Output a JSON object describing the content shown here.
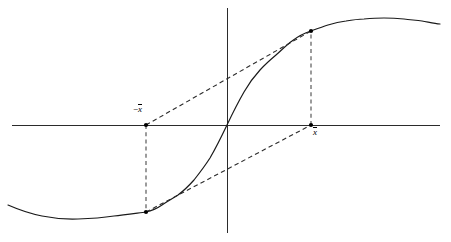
{
  "figure": {
    "labels": {
      "left_point": {
        "minus": "−",
        "symbol": "x",
        "full_text": "−x̄",
        "x": 133,
        "y": 105
      },
      "right_point": {
        "symbol": "x",
        "full_text": "x̄",
        "x": 313,
        "y": 128
      }
    },
    "colors": {
      "axis": "#2b2b2b",
      "curve": "#1a1a1a",
      "dashed_drop": "#4a4a4a",
      "dashed_chord": "#2b2b2b",
      "marker": "#000000",
      "background": "#ffffff"
    }
  },
  "chart_data": {
    "type": "line",
    "title": "",
    "xlabel": "",
    "ylabel": "",
    "grid": false,
    "legend": null,
    "axes": {
      "origin_px": [
        227,
        125
      ],
      "x_axis_px": {
        "x1": 12,
        "y1": 125,
        "x2": 440,
        "y2": 125
      },
      "y_axis_px": {
        "x1": 227,
        "y1": 8,
        "x2": 227,
        "y2": 233
      }
    },
    "curve_points_px": [
      [
        8,
        205
      ],
      [
        24,
        211
      ],
      [
        42,
        216
      ],
      [
        60,
        219
      ],
      [
        78,
        219
      ],
      [
        96,
        218
      ],
      [
        114,
        216
      ],
      [
        130,
        214
      ],
      [
        146,
        212
      ],
      [
        162,
        205
      ],
      [
        178,
        195
      ],
      [
        194,
        180
      ],
      [
        210,
        158
      ],
      [
        227,
        125
      ],
      [
        244,
        92
      ],
      [
        260,
        70
      ],
      [
        276,
        55
      ],
      [
        292,
        41
      ],
      [
        311,
        31
      ],
      [
        328,
        25
      ],
      [
        346,
        21
      ],
      [
        364,
        19
      ],
      [
        384,
        18
      ],
      [
        404,
        19
      ],
      [
        422,
        21
      ],
      [
        440,
        24
      ]
    ],
    "markers": [
      {
        "name": "left-axis-point",
        "px": [
          146,
          125
        ],
        "label": "−x̄"
      },
      {
        "name": "right-axis-point",
        "px": [
          311,
          125
        ],
        "label": "x̄"
      },
      {
        "name": "upper-curve-point",
        "px": [
          311,
          31
        ],
        "label": ""
      },
      {
        "name": "lower-curve-point",
        "px": [
          146,
          212
        ],
        "label": ""
      }
    ],
    "drop_lines": [
      {
        "name": "left-drop",
        "x1": 146,
        "y1": 125,
        "x2": 146,
        "y2": 212
      },
      {
        "name": "right-drop",
        "x1": 311,
        "y1": 125,
        "x2": 311,
        "y2": 31
      }
    ],
    "chords": [
      {
        "name": "upper-chord",
        "x1": 146,
        "y1": 125,
        "x2": 311,
        "y2": 31
      },
      {
        "name": "lower-chord",
        "x1": 146,
        "y1": 212,
        "x2": 311,
        "y2": 125
      }
    ]
  }
}
